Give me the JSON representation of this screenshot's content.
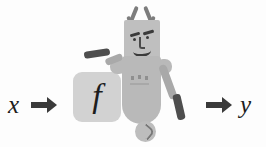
{
  "diagram": {
    "type": "function-block-diagram",
    "input_label": "x",
    "output_label": "y",
    "function_label": "f",
    "arrow_in": "right-arrow-icon",
    "arrow_out": "right-arrow-icon"
  },
  "character": {
    "description": "cartoon robot figure holding a bat with a ball at its feet",
    "parts": {
      "antenna_left": "antenna-icon",
      "antenna_right": "antenna-icon",
      "head": "robot-head",
      "eyebrow_left": "eyebrow",
      "eyebrow_right": "eyebrow",
      "eye_left": "eye",
      "eye_right": "eye",
      "nose": "nose",
      "mouth": "smile",
      "torso": "torso",
      "shoulder_left": "shoulder",
      "shoulder_right": "shoulder",
      "arm_left": "arm",
      "bat": "bat",
      "arm_right_upper": "arm",
      "arm_right_hand": "hand",
      "ball": "ball"
    }
  },
  "colors": {
    "background": "#fdfdfd",
    "box_fill": "#d2d2d2",
    "arrow": "#3a3a3a",
    "body": "#b9b9b9",
    "head": "#bfbfbf",
    "dark_accent": "#4e4e4e",
    "text": "#1d1d1d"
  }
}
